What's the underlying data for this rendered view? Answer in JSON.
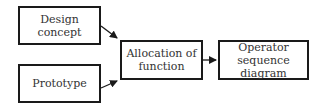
{
  "diagram": {
    "type": "flowchart",
    "nodes": [
      {
        "id": "design_concept",
        "label": "Design concept"
      },
      {
        "id": "prototype",
        "label": "Prototype"
      },
      {
        "id": "allocation",
        "label_line1": "Allocation of",
        "label_line2": "function"
      },
      {
        "id": "operator_sequence",
        "label_line1": "Operator sequence",
        "label_line2": "diagram"
      }
    ],
    "edges": [
      {
        "from": "design_concept",
        "to": "allocation"
      },
      {
        "from": "prototype",
        "to": "allocation"
      },
      {
        "from": "allocation",
        "to": "operator_sequence"
      }
    ],
    "colors": {
      "stroke": "#1a1a1a",
      "text": "#333333",
      "background": "#ffffff"
    }
  }
}
